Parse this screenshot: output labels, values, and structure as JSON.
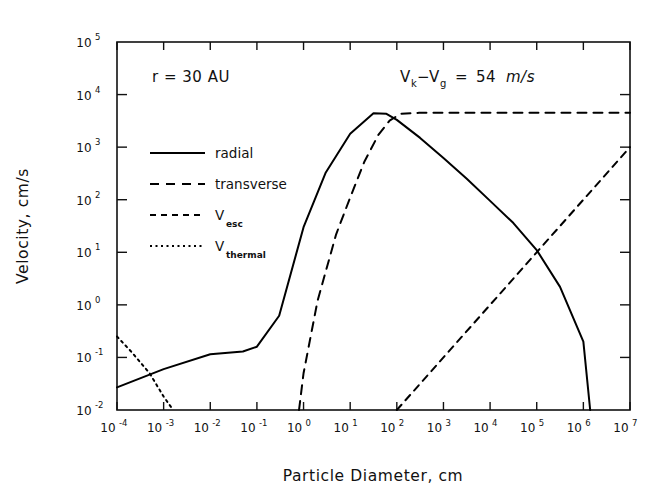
{
  "figure": {
    "background": "#ffffff",
    "ink_color": "#000000"
  },
  "axes": {
    "xlabel": "Particle Diameter, cm",
    "ylabel": "Velocity, cm/s",
    "x_tick_labels": [
      "10-4",
      "10-3",
      "10-2",
      "10-1",
      "100",
      "101",
      "102",
      "103",
      "104",
      "105",
      "106",
      "107"
    ],
    "x_tick_mantissa": [
      "10",
      "10",
      "10",
      "10",
      "10",
      "10",
      "10",
      "10",
      "10",
      "10",
      "10",
      "10"
    ],
    "x_tick_exponents": [
      "-4",
      "-3",
      "-2",
      "-1",
      "0",
      "1",
      "2",
      "3",
      "4",
      "5",
      "6",
      "7"
    ],
    "y_tick_mantissa": [
      "10",
      "10",
      "10",
      "10",
      "10",
      "10",
      "10",
      "10"
    ],
    "y_tick_exponents": [
      "5",
      "4",
      "3",
      "2",
      "1",
      "0",
      "-1",
      "-2"
    ]
  },
  "annotations": {
    "radius": {
      "text": "r  =  30  AU"
    },
    "velocity_diff": {
      "v": "V",
      "k_sub": "k",
      "minus": "−",
      "v2": "V",
      "g_sub": "g",
      "equals": "=",
      "value": "54",
      "units": "m/s"
    }
  },
  "legend": {
    "entries": [
      {
        "label": "radial",
        "style": "solid",
        "sub": ""
      },
      {
        "label": "transverse",
        "style": "dashed",
        "sub": ""
      },
      {
        "label": "V",
        "style": "dashed-short",
        "sub": "esc"
      },
      {
        "label": "V",
        "style": "dotted",
        "sub": "thermal"
      }
    ]
  },
  "chart_data": {
    "type": "line",
    "title": "",
    "xlabel": "Particle Diameter, cm",
    "ylabel": "Velocity, cm/s",
    "xscale": "log",
    "yscale": "log",
    "xlim": [
      0.0001,
      10000000
    ],
    "ylim": [
      0.01,
      100000
    ],
    "grid": false,
    "legend_position": "upper-left-inside",
    "series": [
      {
        "name": "radial",
        "style": "solid",
        "x": [
          0.0001,
          0.001,
          0.01,
          0.05,
          0.1,
          0.3,
          1.0,
          3.0,
          10.0,
          31.6,
          60.0,
          100.0,
          316.0,
          1000.0,
          3160.0,
          10000.0,
          31600.0,
          100000.0,
          316000.0,
          1000000.0,
          1400000.0
        ],
        "y": [
          0.027,
          0.06,
          0.115,
          0.13,
          0.16,
          0.62,
          30.0,
          330.0,
          1800.0,
          4400.0,
          4300.0,
          3300.0,
          1500.0,
          620.0,
          250.0,
          95.0,
          36.0,
          11.0,
          2.2,
          0.2,
          0.01
        ]
      },
      {
        "name": "transverse",
        "style": "dashed",
        "x": [
          0.8,
          1.0,
          2.0,
          5.0,
          10.0,
          20.0,
          40.0,
          70.0,
          120.0,
          300.0,
          1000.0,
          10000.0,
          100000.0,
          1000000.0,
          10000000.0
        ],
        "y": [
          0.01,
          0.05,
          1.2,
          22.0,
          110.0,
          520.0,
          1700.0,
          3200.0,
          4300.0,
          4500.0,
          4500.0,
          4500.0,
          4500.0,
          4500.0,
          4500.0
        ]
      },
      {
        "name": "V_esc",
        "style": "dashed-short",
        "x": [
          100.0,
          1000.0,
          10000.0,
          100000.0,
          1000000.0,
          10000000.0
        ],
        "y": [
          0.01,
          0.1,
          1.0,
          10.0,
          100.0,
          1000.0
        ]
      },
      {
        "name": "V_thermal",
        "style": "dotted",
        "x": [
          0.0001,
          0.0002,
          0.0005,
          0.001,
          0.0016
        ],
        "y": [
          0.25,
          0.13,
          0.05,
          0.018,
          0.01
        ]
      }
    ]
  }
}
